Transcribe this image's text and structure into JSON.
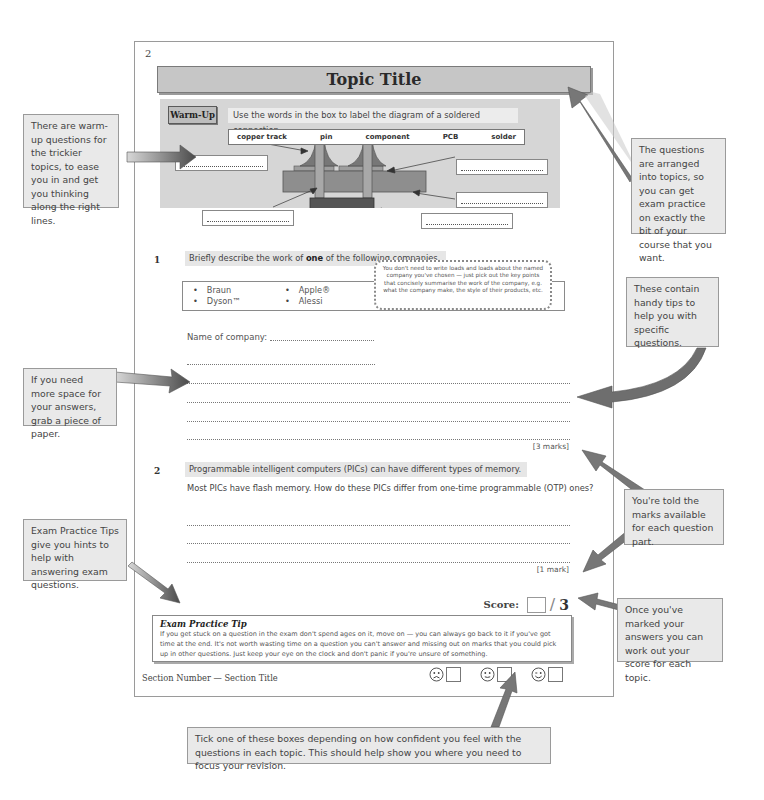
{
  "page": {
    "number": "2",
    "topic_title": "Topic Title",
    "footer_section": "Section Number — Section Title"
  },
  "warmup": {
    "badge": "Warm-Up",
    "instruction": "Use the words in the box to label the diagram of a soldered connection.",
    "words": [
      "copper track",
      "pin",
      "component",
      "PCB",
      "solder"
    ],
    "label_boxes": 5
  },
  "question1": {
    "number": "1",
    "prompt_before": "Briefly describe the work of ",
    "prompt_bold": "one",
    "prompt_after": " of the following companies.",
    "companies": [
      [
        "Braun",
        "Dyson™"
      ],
      [
        "Apple®",
        "Alessi"
      ],
      [
        "Gap",
        "ZARA"
      ],
      [
        "Primark®",
        "Under Armour®"
      ]
    ],
    "name_label": "Name of company:",
    "tip": "You don't need to write loads and loads about the named company you've chosen — just pick out the key points that concisely summarise the work of the company, e.g. what the company make, the style of their products, etc.",
    "marks": "[3 marks]"
  },
  "question2": {
    "number": "2",
    "prompt": "Programmable intelligent computers (PICs) can have different types of memory.",
    "sub": "Most PICs have flash memory.  How do these PICs differ from one-time programmable (OTP) ones?",
    "marks": "[1 mark]"
  },
  "score": {
    "label": "Score:",
    "slash": "/",
    "total": "3"
  },
  "exam_tip": {
    "title": "Exam Practice Tip",
    "body": "If you get stuck on a question in the exam don't spend ages on it, move on — you can always go back to it if you've got time at the end.  It's not worth wasting time on a question you can't answer and missing out on marks that you could pick up in other questions.  Just keep your eye on the clock and don't panic if you're unsure of something."
  },
  "confidence": {
    "options": [
      "sad-face",
      "neutral-face",
      "happy-face"
    ]
  },
  "annotations": {
    "warmup": "There are warm-up questions for the trickier topics, to ease you in and get you thinking along the right lines.",
    "topics": "The questions are arranged into topics, so you can get exam practice on exactly the bit of your course that you want.",
    "tips": "These contain handy tips to help you with specific questions.",
    "space": "If you need more space for your answers, grab a piece of paper.",
    "marks": "You're told the marks available for each question part.",
    "exam_tips": "Exam Practice Tips give you hints to help with answering exam questions.",
    "score": "Once you've marked your answers you can work out your score for each topic.",
    "confidence": "Tick one of these boxes depending on how confident you feel with the questions in each topic.  This should help show you where you need to focus your revision."
  },
  "colors": {
    "panel_grey": "#d6d6d6",
    "title_bar": "#c6c6c6",
    "note_bg": "#e9e9e9",
    "component_dark": "#555555",
    "pcb": "#8e8e8e",
    "arrow": "#6a6a6a"
  }
}
